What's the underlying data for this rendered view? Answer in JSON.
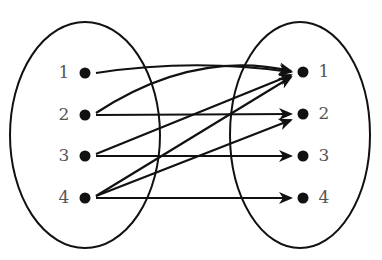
{
  "diagram": {
    "type": "relation-mapping",
    "colors": {
      "stroke": "#111111",
      "label": "#555555",
      "background": "#ffffff"
    },
    "domain_set": {
      "ellipse": {
        "cx": 85,
        "cy": 135,
        "rx": 75,
        "ry": 113
      },
      "elements": [
        {
          "label": "1",
          "x": 85,
          "y": 73
        },
        {
          "label": "2",
          "x": 85,
          "y": 115
        },
        {
          "label": "3",
          "x": 85,
          "y": 156
        },
        {
          "label": "4",
          "x": 85,
          "y": 198
        }
      ]
    },
    "codomain_set": {
      "ellipse": {
        "cx": 300,
        "cy": 135,
        "rx": 70,
        "ry": 113
      },
      "elements": [
        {
          "label": "1",
          "x": 303,
          "y": 72
        },
        {
          "label": "2",
          "x": 303,
          "y": 114
        },
        {
          "label": "3",
          "x": 303,
          "y": 156
        },
        {
          "label": "4",
          "x": 303,
          "y": 198
        }
      ]
    },
    "mappings": [
      {
        "from": "1",
        "to": "1",
        "style": "curved"
      },
      {
        "from": "2",
        "to": "1",
        "style": "curved"
      },
      {
        "from": "2",
        "to": "2",
        "style": "straight"
      },
      {
        "from": "3",
        "to": "1",
        "style": "straight"
      },
      {
        "from": "3",
        "to": "3",
        "style": "straight"
      },
      {
        "from": "4",
        "to": "1",
        "style": "straight"
      },
      {
        "from": "4",
        "to": "2",
        "style": "straight"
      },
      {
        "from": "4",
        "to": "4",
        "style": "straight"
      }
    ]
  }
}
